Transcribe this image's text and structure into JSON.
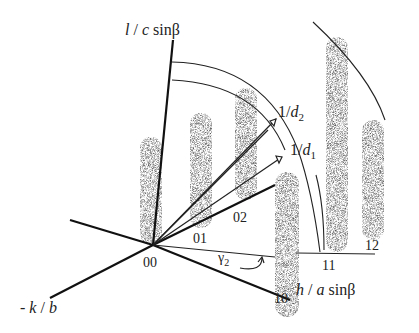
{
  "diagram": {
    "axes": {
      "l_axis": "l / c sinβ",
      "h_axis": "h / a sinβ",
      "k_axis": "- k / b"
    },
    "vectors": [
      {
        "label": "1/d",
        "sub": "2"
      },
      {
        "label": "1/d",
        "sub": "1"
      }
    ],
    "angle_label": {
      "text": "γ",
      "sub": "2"
    },
    "rods": [
      "00",
      "01",
      "02",
      "10",
      "11",
      "12"
    ],
    "colors": {
      "line": "#111111",
      "rod": "#555555"
    }
  }
}
